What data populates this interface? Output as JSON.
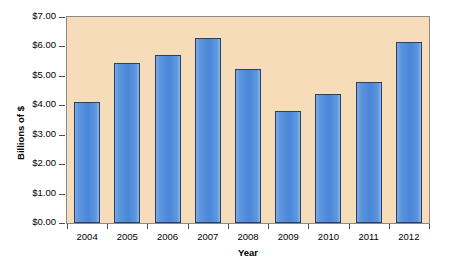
{
  "chart_data": {
    "type": "bar",
    "title": "",
    "xlabel": "Year",
    "ylabel": "Billions of $",
    "categories": [
      "2004",
      "2005",
      "2006",
      "2007",
      "2008",
      "2009",
      "2010",
      "2011",
      "2012"
    ],
    "values": [
      4.1,
      5.45,
      5.7,
      6.3,
      5.25,
      3.8,
      4.4,
      4.8,
      6.15
    ],
    "ylim": [
      0.0,
      7.0
    ],
    "ytick_values": [
      0.0,
      1.0,
      2.0,
      3.0,
      4.0,
      5.0,
      6.0,
      7.0
    ],
    "ytick_labels": [
      "$0.00",
      "$1.00",
      "$2.00",
      "$3.00",
      "$4.00",
      "$5.00",
      "$6.00",
      "$7.00"
    ],
    "grid": false,
    "legend": null,
    "series": [
      {
        "name": "Billions of $",
        "values": [
          4.1,
          5.45,
          5.7,
          6.3,
          5.25,
          3.8,
          4.4,
          4.8,
          6.15
        ]
      }
    ],
    "colors": {
      "bar_fill": "#4a87d8",
      "bar_border": "#2b3f63",
      "plot_background": "#f7dcba",
      "plot_border": "#8a8a8a",
      "axis_text": "#000000",
      "page_background": "#ffffff"
    }
  }
}
